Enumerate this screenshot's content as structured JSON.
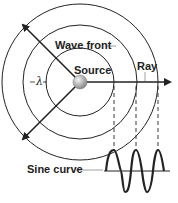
{
  "diagram": {
    "labels": {
      "wave_front": "Wave front",
      "source": "Source",
      "ray": "Ray",
      "lambda": "λ",
      "sine_curve": "Sine curve"
    },
    "colors": {
      "line": "#222222",
      "sphere_light": "#f2f2f2",
      "sphere_dark": "#8a8a8a",
      "leader": "#888888"
    },
    "geometry": {
      "center": [
        80,
        82
      ],
      "radii": [
        34,
        57,
        78
      ],
      "source_radius": 7
    }
  }
}
